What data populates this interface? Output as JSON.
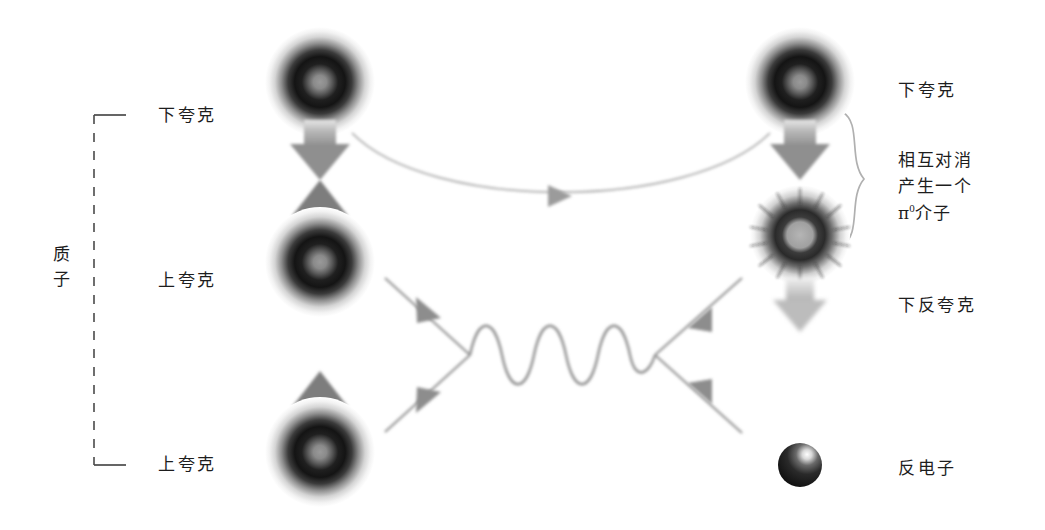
{
  "diagram": {
    "type": "feynman-diagram",
    "background_color": "#ffffff",
    "ink_color": "#1d1d1d",
    "line_color": "#8d8d8d"
  },
  "left_group": {
    "bracket_label_line1": "质",
    "bracket_label_line2": "子",
    "bracket_name": "proton-bracket",
    "bracket_style": "dashed-vertical-with-end-ticks",
    "items": [
      {
        "label": "下夸克",
        "role": "down-quark",
        "spin": "down"
      },
      {
        "label": "上夸克",
        "role": "up-quark",
        "spin": "up"
      },
      {
        "label": "上夸克",
        "role": "up-quark",
        "spin": "up"
      }
    ]
  },
  "right_labels": {
    "down_quark": "下夸克",
    "annihilation_line1": "相互对消",
    "annihilation_line2": "产生一个",
    "annihilation_pi": "π",
    "annihilation_pi_sup": "0",
    "annihilation_meson": "介子",
    "down_antiquark": "下反夸克",
    "positron": "反电子"
  },
  "particles": [
    {
      "name": "down-quark-in",
      "side": "left",
      "cx": 320,
      "cy": 82,
      "r": 52,
      "style": "ring-sphere",
      "arrow": "down",
      "arrow_pos": "below"
    },
    {
      "name": "up-quark-middle",
      "side": "left",
      "cx": 320,
      "cy": 262,
      "r": 52,
      "style": "ring-sphere",
      "arrow": "up",
      "arrow_pos": "above"
    },
    {
      "name": "up-quark-bottom",
      "side": "left",
      "cx": 320,
      "cy": 452,
      "r": 52,
      "style": "ring-sphere",
      "arrow": "up",
      "arrow_pos": "above"
    },
    {
      "name": "down-quark-out",
      "side": "right",
      "cx": 800,
      "cy": 82,
      "r": 52,
      "style": "ring-sphere",
      "arrow": "down",
      "arrow_pos": "below"
    },
    {
      "name": "down-antiquark",
      "side": "right",
      "cx": 800,
      "cy": 235,
      "r": 48,
      "style": "starburst-sphere",
      "arrow": "down",
      "arrow_pos": "below"
    },
    {
      "name": "positron-sphere",
      "side": "right",
      "cx": 800,
      "cy": 465,
      "r": 22,
      "style": "glossy-sphere",
      "arrow": "none",
      "arrow_pos": "none"
    }
  ],
  "connectors": [
    {
      "name": "quark-transfer-arc",
      "type": "curved-arrow",
      "from": "down-quark-in",
      "to": "down-quark-out",
      "direction": "right"
    },
    {
      "name": "incoming-upper-line",
      "type": "straight-arrow",
      "direction": "down-right"
    },
    {
      "name": "incoming-lower-line",
      "type": "straight-arrow",
      "direction": "up-right"
    },
    {
      "name": "boson-wave",
      "type": "sine-wave",
      "periods": 5
    },
    {
      "name": "outgoing-upper-line",
      "type": "straight-arrow",
      "direction": "up-right"
    },
    {
      "name": "outgoing-lower-line",
      "type": "straight-arrow",
      "direction": "down-right"
    }
  ]
}
